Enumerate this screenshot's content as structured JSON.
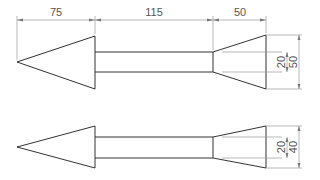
{
  "drawing": {
    "title": "Arrow technical drawing",
    "top_dimensions": {
      "head_length": "75",
      "shaft_length": "115",
      "tail_length": "50"
    },
    "view_a": {
      "inner_height": "20",
      "outer_height": "50"
    },
    "view_b": {
      "inner_height": "20",
      "outer_height": "40"
    },
    "colors": {
      "object_line": "#333333",
      "dimension_line": "#9a9a9a",
      "text": "#555555"
    }
  }
}
